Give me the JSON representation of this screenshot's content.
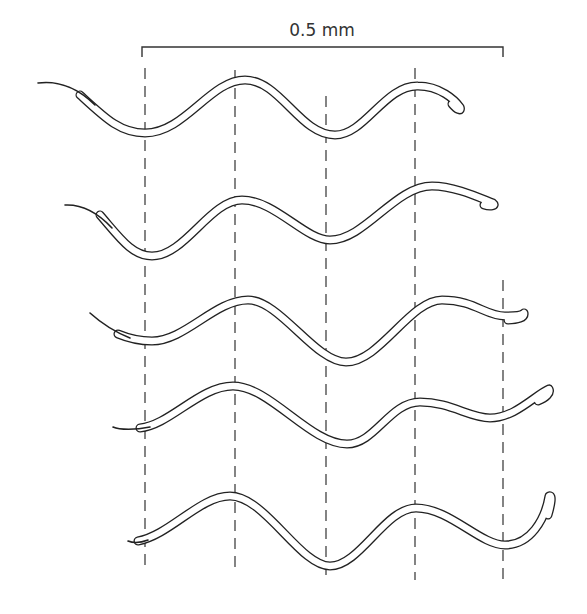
{
  "figure": {
    "scale_bar": {
      "label": "0.5 mm",
      "x_start": 142,
      "x_end": 503,
      "y": 47,
      "tick_height": 10
    },
    "reference_lines": [
      {
        "x": 145,
        "y_start": 68,
        "y_end": 572
      },
      {
        "x": 235,
        "y_start": 70,
        "y_end": 572
      },
      {
        "x": 326,
        "y_start": 96,
        "y_end": 578
      },
      {
        "x": 415,
        "y_start": 68,
        "y_end": 580
      },
      {
        "x": 503,
        "y_start": 280,
        "y_end": 586
      }
    ],
    "worms": [
      {
        "id": "frame-1",
        "tail": "M38 83 C60 80 80 90 95 105",
        "body": "M80 95 C105 118 120 133 145 133 C185 133 210 80 245 80 C280 80 300 135 335 135 C365 135 385 85 418 86 C440 86 455 100 460 107 C462 112 457 110 452 104"
      },
      {
        "id": "frame-2",
        "tail": "M65 205 C85 204 100 215 112 228",
        "body": "M100 215 C120 238 132 256 152 256 C185 256 210 200 242 200 C275 200 305 240 330 240 C365 240 395 186 432 186 C455 186 480 198 493 203 C497 206 490 207 484 205"
      },
      {
        "id": "frame-3",
        "tail": "M90 313 C100 322 115 332 130 338",
        "body": "M118 334 C130 339 140 341 152 341 C185 341 215 300 248 300 C280 300 315 362 346 362 C380 362 410 300 442 300 C475 300 485 316 505 316 C515 316 522 315 524 313 C525 318 517 320 508 320"
      },
      {
        "id": "frame-4",
        "tail": "M113 427 C120 430 135 430 150 427",
        "body": "M140 428 C170 425 200 386 233 386 C270 386 310 444 347 444 C375 444 390 402 420 402 C450 402 470 418 490 418 C515 418 535 395 549 389 C551 393 546 398 538 401"
      },
      {
        "id": "frame-5",
        "tail": "M128 541 C133 543 140 543 148 540",
        "body": "M138 541 C170 535 200 496 230 496 C265 496 300 566 330 566 C360 566 385 508 416 508 C450 508 480 545 505 545 C530 545 545 520 549 496 C553 494 551 505 548 515"
      }
    ]
  },
  "colors": {
    "ink": "#222222",
    "background": "#ffffff"
  }
}
